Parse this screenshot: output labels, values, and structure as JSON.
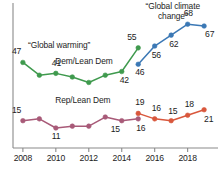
{
  "chart_data": {
    "type": "line",
    "title": "",
    "subtitle": "",
    "xlabel": "",
    "ylabel": "",
    "x": [
      2008,
      2009,
      2010,
      2011,
      2012,
      2013,
      2014,
      2015,
      2016,
      2017,
      2018,
      2019
    ],
    "xlim": [
      2007.4,
      2019.6
    ],
    "ylim": [
      0,
      78
    ],
    "grid": false,
    "legend_position": "inline-annotations",
    "xticks": [
      "2008",
      "2010",
      "2012",
      "2014",
      "2016",
      "2018"
    ],
    "xtick_values": [
      2008,
      2010,
      2012,
      2014,
      2016,
      2018
    ],
    "annotations": [
      {
        "text": "“Global warming”",
        "x": 2010.2,
        "y": 56
      },
      {
        "text": "“Global climate\nchange”",
        "x": 2017.1,
        "y": 79
      }
    ],
    "series": [
      {
        "name": "Dem/Lean Dem",
        "phrase": "“Global warming”",
        "color": "#3f9a4e",
        "x": [
          2008,
          2009,
          2010,
          2011,
          2012,
          2013,
          2014,
          2015
        ],
        "values": [
          47,
          40,
          41,
          39,
          36,
          40,
          42,
          55
        ],
        "point_labels": [
          {
            "x": 2008,
            "value": "47"
          },
          {
            "x": 2010,
            "value": "41"
          },
          {
            "x": 2014,
            "value": "42"
          },
          {
            "x": 2015,
            "value": "55"
          }
        ],
        "series_label": {
          "text": "Dem/Lean Dem",
          "x": 2011.6,
          "y": 47
        }
      },
      {
        "name": "Dem/Lean Dem",
        "phrase": "“Global climate change”",
        "color": "#3b78b5",
        "x": [
          2015,
          2016,
          2017,
          2018,
          2019
        ],
        "values": [
          46,
          56,
          62,
          68,
          67
        ],
        "point_labels": [
          {
            "x": 2015,
            "value": "46"
          },
          {
            "x": 2016,
            "value": "56"
          },
          {
            "x": 2017,
            "value": "62"
          },
          {
            "x": 2018,
            "value": "68"
          },
          {
            "x": 2019,
            "value": "67"
          }
        ],
        "series_label": null
      },
      {
        "name": "Rep/Lean Dem",
        "phrase": "“Global warming”",
        "color": "#a85a78",
        "x": [
          2008,
          2009,
          2010,
          2011,
          2012,
          2013,
          2014,
          2015
        ],
        "values": [
          15,
          16,
          11,
          12,
          12,
          17,
          15,
          16
        ],
        "point_labels": [
          {
            "x": 2008,
            "value": "15"
          },
          {
            "x": 2010,
            "value": "11"
          },
          {
            "x": 2014,
            "value": "15"
          },
          {
            "x": 2015,
            "value": "16"
          }
        ],
        "series_label": {
          "text": "Rep/Lean Dem",
          "x": 2011.6,
          "y": 26
        }
      },
      {
        "name": "Rep/Lean Dem",
        "phrase": "“Global climate change”",
        "color": "#d9573c",
        "x": [
          2015,
          2016,
          2017,
          2018,
          2019
        ],
        "values": [
          19,
          16,
          15,
          18,
          21
        ],
        "point_labels": [
          {
            "x": 2015,
            "value": "19"
          },
          {
            "x": 2016,
            "value": "16"
          },
          {
            "x": 2017,
            "value": "15"
          },
          {
            "x": 2018,
            "value": "18"
          },
          {
            "x": 2019,
            "value": "21"
          }
        ],
        "series_label": null
      }
    ]
  },
  "axis": {
    "line_color": "#8a8a8a"
  }
}
